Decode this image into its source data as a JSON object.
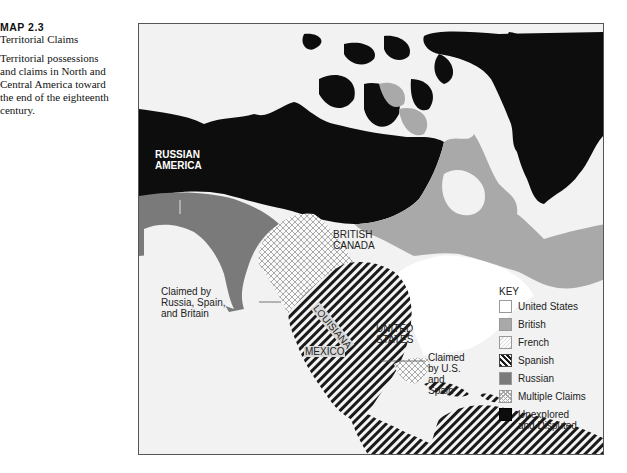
{
  "caption": {
    "number": "MAP 2.3",
    "title": "Territorial Claims",
    "description_lines": [
      "Territorial possessions",
      "and claims in North and",
      "Central America toward",
      "the end of the eighteenth",
      "century."
    ]
  },
  "map": {
    "labels": {
      "russian_america": [
        "RUSSIAN",
        "AMERICA"
      ],
      "british_canada": [
        "BRITISH",
        "CANADA"
      ],
      "louisiana": "LOUISIANA",
      "mexico": "MEXICO",
      "united_states": [
        "UNITED",
        "STATES"
      ],
      "claimed_rsb": [
        "Claimed by",
        "Russia, Spain,",
        "and Britain"
      ],
      "claimed_us_spain": [
        "Claimed",
        "by U.S.",
        "and",
        "Spain"
      ]
    },
    "colors": {
      "ocean": "#f2f2f2",
      "united_states": "#ffffff",
      "british": "#a9a9a9",
      "french": "#f7f7f7",
      "spanish_stripe": "#1a1a1a",
      "russian": "#7a7a7a",
      "unexplored": "#0d0d0d",
      "frame": "#555555"
    }
  },
  "key": {
    "title": "KEY",
    "items": [
      {
        "id": "united-states",
        "label": "United States",
        "swatch": "white"
      },
      {
        "id": "british",
        "label": "British",
        "swatch": "gray"
      },
      {
        "id": "french",
        "label": "French",
        "swatch": "light-hatch"
      },
      {
        "id": "spanish",
        "label": "Spanish",
        "swatch": "diagonal-stripes"
      },
      {
        "id": "russian",
        "label": "Russian",
        "swatch": "dark-gray"
      },
      {
        "id": "multiple-claims",
        "label": "Multiple Claims",
        "swatch": "crosshatch"
      },
      {
        "id": "unexplored",
        "label_lines": [
          "Unexplored",
          "and Disputed"
        ],
        "swatch": "black"
      }
    ]
  }
}
